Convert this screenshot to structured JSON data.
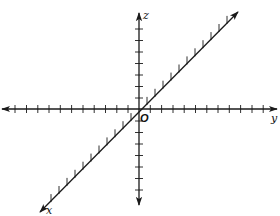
{
  "diagram": {
    "origin": {
      "label": "O",
      "x": 139,
      "y": 109
    },
    "axes": {
      "y": {
        "label": "y",
        "start": [
          2,
          109
        ],
        "end": [
          277,
          109
        ],
        "ticks_x": [
          15,
          26.5,
          37.8,
          49,
          60.3,
          71.6,
          83,
          94.2,
          105.5,
          116.8,
          128,
          150.3,
          161.6,
          173,
          184.2,
          195.5,
          206.8,
          218,
          229.3,
          240.6,
          252,
          263.2
        ]
      },
      "z": {
        "label": "z",
        "start": [
          139,
          205
        ],
        "end": [
          139,
          13
        ],
        "ticks_y": [
          29,
          40.5,
          52,
          63.5,
          75,
          86.5,
          98,
          121,
          132.5,
          144,
          155.5,
          167,
          178.5,
          190
        ]
      },
      "x": {
        "label": "x",
        "start": [
          40,
          212
        ],
        "end": [
          238,
          12
        ],
        "ticks_t": [
          -11,
          -10,
          -9,
          -8,
          -7,
          -6,
          -5,
          -4,
          -3,
          -2,
          -1,
          1,
          2,
          3,
          4,
          5,
          6,
          7,
          8,
          9,
          10,
          11
        ]
      }
    },
    "labels": {
      "x": "x",
      "y": "y",
      "z": "z",
      "origin": "O"
    }
  }
}
